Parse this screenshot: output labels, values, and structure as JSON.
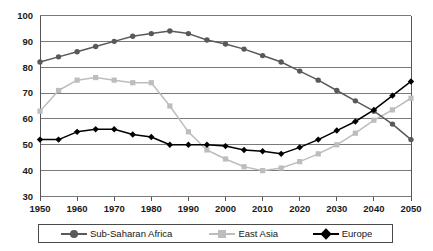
{
  "chart_data": {
    "type": "line",
    "title": "",
    "xlabel": "",
    "ylabel": "",
    "xlim": [
      1950,
      2050
    ],
    "ylim": [
      30,
      100
    ],
    "ytick_step": 10,
    "xtick_step": 10,
    "grid": true,
    "legend_position": "bottom",
    "x": [
      1950,
      1955,
      1960,
      1965,
      1970,
      1975,
      1980,
      1985,
      1990,
      1995,
      2000,
      2005,
      2010,
      2015,
      2020,
      2025,
      2030,
      2035,
      2040,
      2045,
      2050
    ],
    "xticks": [
      "1950",
      "1960",
      "1970",
      "1980",
      "1990",
      "2000",
      "2010",
      "2020",
      "2030",
      "2040",
      "2050"
    ],
    "yticks": [
      "30",
      "40",
      "50",
      "60",
      "70",
      "80",
      "90",
      "100"
    ],
    "series": [
      {
        "name": "Sub-Saharan Africa",
        "color": "#595959",
        "marker": "circle",
        "values": [
          82,
          84,
          86,
          88,
          90,
          92,
          93,
          94,
          93,
          90.5,
          89,
          87,
          84.5,
          82,
          78.5,
          75,
          71,
          67,
          63,
          58,
          52
        ]
      },
      {
        "name": "East Asia",
        "color": "#bdbdbd",
        "marker": "square",
        "values": [
          63,
          71,
          75,
          76,
          75,
          74,
          74,
          65,
          55,
          48,
          44.5,
          41.5,
          40,
          41,
          43.5,
          46.5,
          50,
          54.5,
          59.5,
          63.5,
          68
        ]
      },
      {
        "name": "Europe",
        "color": "#000000",
        "marker": "diamond",
        "values": [
          52,
          52,
          55,
          56,
          56,
          54,
          53,
          50,
          50,
          50,
          49.5,
          48,
          47.5,
          46.5,
          49,
          52,
          55.5,
          59,
          63.5,
          69,
          74.5
        ]
      }
    ]
  },
  "legend": {
    "entries": [
      {
        "label": "Sub-Saharan Africa"
      },
      {
        "label": "East Asia"
      },
      {
        "label": "Europe"
      }
    ]
  }
}
